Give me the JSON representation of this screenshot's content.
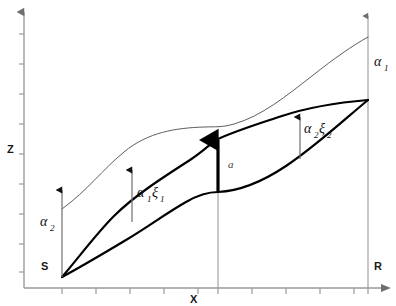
{
  "figure": {
    "type": "diagram",
    "background_color": "#ffffff",
    "axes": {
      "x_label": "X",
      "y_label": "Z",
      "axis_color": "#9a9a9a",
      "x_axis_y": 288,
      "y_axis_x": 24,
      "x_tick_count": 11,
      "y_tick_count": 9
    },
    "endpoints": {
      "source_label": "S",
      "receiver_label": "R",
      "source_point": [
        62,
        277
      ],
      "receiver_point": [
        368,
        100
      ]
    },
    "annotations": [
      {
        "name": "alpha-2-left",
        "base": "α",
        "sub": "2",
        "x": 48,
        "y": 222,
        "arrow_x": 62,
        "arrow_y_bottom": 277,
        "arrow_y_top": 190
      },
      {
        "name": "alpha-1-right",
        "base": "α",
        "sub": "1",
        "x": 376,
        "y": 66,
        "arrow_x": 368,
        "arrow_y_bottom": 288,
        "arrow_y_top": 16
      },
      {
        "name": "alpha-1-xi-1",
        "base": "α",
        "sub": "1",
        "base2": "ξ",
        "sub2": "1",
        "x": 137,
        "y": 197,
        "arrow_x": 132,
        "arrow_y_bottom": 220,
        "arrow_y_top": 172
      },
      {
        "name": "alpha-2-xi-2",
        "base": "α",
        "sub": "2",
        "base2": "ξ",
        "sub2": "2",
        "x": 303,
        "y": 133,
        "arrow_x": 300,
        "arrow_y_bottom": 158,
        "arrow_y_top": 119
      },
      {
        "name": "amplitude-a",
        "text": "a",
        "x": 228,
        "y": 166,
        "arrow_x": 218,
        "arrow_y_bottom": 192,
        "arrow_y_top": 139
      }
    ],
    "curves": {
      "thin_upper": {
        "stroke": "#555555",
        "stroke_width": 0.9,
        "start": [
          62,
          209
        ],
        "end": [
          368,
          37
        ]
      },
      "thick_upper": {
        "stroke": "#000000",
        "stroke_width": 2.2,
        "start": [
          62,
          277
        ],
        "end": [
          368,
          100
        ]
      },
      "thick_lower": {
        "stroke": "#000000",
        "stroke_width": 2.2,
        "start": [
          62,
          277
        ],
        "end": [
          368,
          100
        ]
      }
    },
    "guides": {
      "center_line_x": 218,
      "center_line_top": 192,
      "center_line_bottom": 288,
      "right_line_x": 368,
      "guide_color": "#9a9a9a"
    }
  }
}
